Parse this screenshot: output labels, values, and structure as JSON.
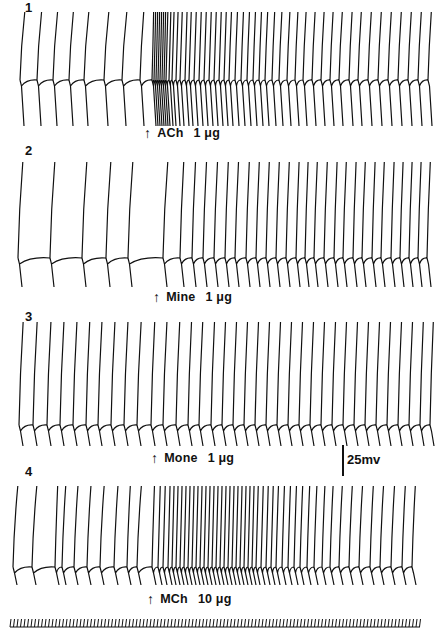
{
  "figure": {
    "width": 435,
    "height": 636,
    "ink_color": "#111111",
    "background": "#ffffff"
  },
  "panels": [
    {
      "number": "1",
      "drug": "ACh",
      "dose": "1 μg"
    },
    {
      "number": "2",
      "drug": "Mine",
      "dose": "1 μg"
    },
    {
      "number": "3",
      "drug": "Mone",
      "dose": "1 μg"
    },
    {
      "number": "4",
      "drug": "MCh",
      "dose": "10 μg"
    }
  ],
  "scale_bar": {
    "label": "25mv"
  },
  "chart_data": {
    "type": "line",
    "title": "",
    "xlabel": "time",
    "ylabel": "membrane potential",
    "scale_bar_mV": 25,
    "panels": [
      {
        "id": 1,
        "drug": "ACh",
        "dose_ug": 1,
        "arrow_x": 148,
        "baseline_y": 80,
        "top_y": 12,
        "bottom_y": 126,
        "spike_x": [
          20,
          37,
          53,
          69,
          84,
          104,
          122,
          140,
          152,
          154,
          156,
          158,
          160,
          162,
          164,
          166,
          169,
          172,
          176,
          180,
          185,
          189,
          194,
          199,
          204,
          209,
          214,
          219,
          224,
          229,
          235,
          241,
          247,
          253,
          259,
          265,
          272,
          279,
          287,
          295,
          303,
          312,
          321,
          330,
          339,
          349,
          358,
          368,
          378,
          388,
          398,
          408,
          418,
          428
        ],
        "phases": [
          "control (~regular firing)",
          "burst of rapid firing immediately after ACh",
          "gradual slowing of firing rate"
        ]
      },
      {
        "id": 2,
        "drug": "Mine",
        "dose_ug": 1,
        "arrow_x": 157,
        "baseline_y": 258,
        "top_y": 162,
        "bottom_y": 287,
        "spike_x": [
          18,
          50,
          82,
          106,
          128,
          163,
          180,
          192,
          203,
          214,
          225,
          235,
          246,
          256,
          266,
          276,
          286,
          296,
          305,
          314,
          324,
          334,
          343,
          353,
          362,
          372,
          381,
          391,
          400,
          409,
          418,
          427
        ],
        "phases": [
          "slow control firing",
          "marked acceleration after Mine"
        ]
      },
      {
        "id": 3,
        "drug": "Mone",
        "dose_ug": 1,
        "arrow_x": 155,
        "baseline_y": 425,
        "top_y": 322,
        "bottom_y": 446,
        "spike_x": [
          19,
          33,
          47,
          60,
          73,
          86,
          98,
          111,
          124,
          137,
          151,
          163,
          176,
          188,
          199,
          211,
          222,
          233,
          244,
          255,
          266,
          277,
          288,
          299,
          310,
          321,
          332,
          343,
          354,
          365,
          376,
          387,
          398,
          409,
          420,
          430
        ],
        "phases": [
          "control firing",
          "moderate acceleration after Mone"
        ]
      },
      {
        "id": 4,
        "drug": "MCh",
        "dose_ug": 10,
        "arrow_x": 151,
        "baseline_y": 567,
        "top_y": 486,
        "bottom_y": 585,
        "spike_x": [
          13,
          32,
          55,
          62,
          74,
          87,
          100,
          114,
          127,
          137,
          152,
          158,
          163,
          168,
          172,
          176,
          180,
          184,
          188,
          192,
          196,
          200,
          204,
          208,
          212,
          216,
          220,
          224,
          228,
          232,
          236,
          240,
          244,
          248,
          252,
          256,
          261,
          266,
          271,
          276,
          282,
          288,
          294,
          300,
          307,
          314,
          322,
          330,
          339,
          349,
          359,
          370,
          380,
          391,
          402,
          412
        ],
        "phases": [
          "irregular slow control firing",
          "strong burst of rapid firing after MCh",
          "gradual slowing"
        ]
      }
    ],
    "time_marker": {
      "y": 623,
      "x_start": 10,
      "x_end": 420,
      "tick_spacing": 3.5
    },
    "annotations": [
      "1",
      "2",
      "3",
      "4",
      "ACh 1 μg",
      "Mine 1 μg",
      "Mone 1 μg",
      "MCh 10 μg",
      "25mv"
    ]
  }
}
